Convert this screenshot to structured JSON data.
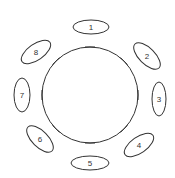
{
  "diagram": {
    "type": "circular-arrangement",
    "circle": {
      "cx": 90,
      "cy": 95,
      "r": 48,
      "stroke": "#333333"
    },
    "tick_angles_deg": [
      -90,
      -45,
      0,
      45,
      90,
      135,
      180,
      225
    ],
    "nodes": [
      {
        "label": "1",
        "cx": 91,
        "cy": 27,
        "rx": 18,
        "ry": 7,
        "rot": 0
      },
      {
        "label": "2",
        "cx": 147,
        "cy": 56,
        "rx": 17,
        "ry": 8,
        "rot": 45
      },
      {
        "label": "3",
        "cx": 159,
        "cy": 99,
        "rx": 7,
        "ry": 17,
        "rot": 0
      },
      {
        "label": "4",
        "cx": 139,
        "cy": 145,
        "rx": 17,
        "ry": 8,
        "rot": -35
      },
      {
        "label": "5",
        "cx": 90,
        "cy": 163,
        "rx": 19,
        "ry": 7,
        "rot": 0
      },
      {
        "label": "6",
        "cx": 40,
        "cy": 139,
        "rx": 17,
        "ry": 8,
        "rot": 45
      },
      {
        "label": "7",
        "cx": 22,
        "cy": 95,
        "rx": 8,
        "ry": 17,
        "rot": 0
      },
      {
        "label": "8",
        "cx": 36,
        "cy": 52,
        "rx": 17,
        "ry": 8,
        "rot": -35
      }
    ]
  }
}
